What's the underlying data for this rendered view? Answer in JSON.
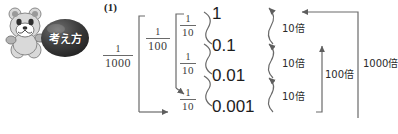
{
  "problem": {
    "number": "(1)"
  },
  "mascot": {
    "badge_label": "考え方",
    "character": "bear-mascot",
    "badge_color": "#3b3b3b"
  },
  "diagram": {
    "type": "nested-fraction-decimal-place-value",
    "left_fractions": [
      {
        "id": "f1000",
        "numerator": "1",
        "denominator": "1000",
        "label": "1/1000"
      },
      {
        "id": "f100",
        "numerator": "1",
        "denominator": "100",
        "label": "1/100"
      }
    ],
    "tenth_fractions": [
      {
        "id": "f10a",
        "numerator": "1",
        "denominator": "10",
        "label": "1/10"
      },
      {
        "id": "f10b",
        "numerator": "1",
        "denominator": "10",
        "label": "1/10"
      },
      {
        "id": "f10c",
        "numerator": "1",
        "denominator": "10",
        "label": "1/10"
      }
    ],
    "decimals": [
      {
        "value": "1"
      },
      {
        "value": "0.1"
      },
      {
        "value": "0.01"
      },
      {
        "value": "0.001"
      }
    ],
    "multipliers": [
      {
        "id": "m10a",
        "label": "10倍"
      },
      {
        "id": "m10b",
        "label": "10倍"
      },
      {
        "id": "m10c",
        "label": "10倍"
      },
      {
        "id": "m100",
        "label": "100倍"
      },
      {
        "id": "m1000",
        "label": "1000倍"
      }
    ],
    "line_color": "#6a6a6a",
    "text_color": "#1d1d1d"
  }
}
